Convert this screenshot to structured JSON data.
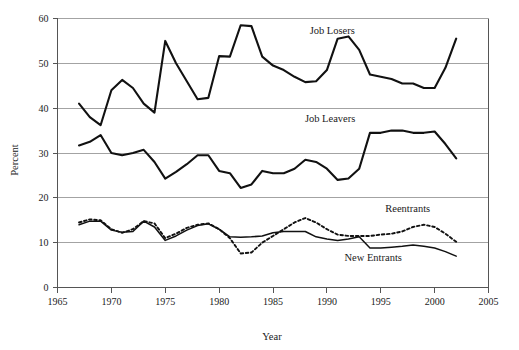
{
  "chart_data": {
    "type": "line",
    "title": "",
    "xlabel": "Year",
    "ylabel": "Percent",
    "xlim": [
      1965,
      2005
    ],
    "ylim": [
      0,
      60
    ],
    "xticks": [
      1965,
      1970,
      1975,
      1980,
      1985,
      1990,
      1995,
      2000,
      2005
    ],
    "xtick_labels": [
      "1965",
      "1970",
      "1975",
      "1980",
      "1985",
      "1990",
      "1995",
      "2000",
      "2005"
    ],
    "yticks": [
      0,
      10,
      20,
      30,
      40,
      50,
      60
    ],
    "ytick_labels": [
      "0",
      "10",
      "20",
      "30",
      "40",
      "50",
      "60"
    ],
    "grid": "horizontal",
    "legend_position": "inline-annotations",
    "x": [
      1967,
      1968,
      1969,
      1970,
      1971,
      1972,
      1973,
      1974,
      1975,
      1976,
      1977,
      1978,
      1979,
      1980,
      1981,
      1982,
      1983,
      1984,
      1985,
      1986,
      1987,
      1988,
      1989,
      1990,
      1991,
      1992,
      1993,
      1994,
      1995,
      1996,
      1997,
      1998,
      1999,
      2000,
      2001,
      2002
    ],
    "series": [
      {
        "name": "Job Losers",
        "style": "solid",
        "values": [
          41.0,
          38.0,
          36.2,
          44.0,
          46.3,
          44.5,
          41.0,
          39.0,
          55.0,
          50.0,
          46.0,
          42.0,
          42.3,
          51.6,
          51.5,
          58.5,
          58.3,
          51.5,
          49.5,
          48.5,
          47.0,
          45.8,
          46.0,
          48.5,
          55.5,
          56.0,
          53.0,
          47.5,
          47.0,
          46.5,
          45.5,
          45.5,
          44.5,
          44.5,
          49.0,
          55.5
        ]
      },
      {
        "name": "Job Leavers",
        "style": "solid",
        "values": [
          31.7,
          32.5,
          34.0,
          30.0,
          29.5,
          30.0,
          30.7,
          28.0,
          24.3,
          25.8,
          27.5,
          29.5,
          29.5,
          26.0,
          25.5,
          22.2,
          23.0,
          26.0,
          25.5,
          25.5,
          26.5,
          28.5,
          28.0,
          26.5,
          24.0,
          24.3,
          26.5,
          34.5,
          34.5,
          35.0,
          35.0,
          34.5,
          34.5,
          34.8,
          32.0,
          28.8
        ]
      },
      {
        "name": "Reentrants",
        "style": "dotted",
        "values": [
          14.5,
          15.2,
          15.0,
          13.0,
          12.2,
          13.0,
          14.8,
          14.3,
          11.0,
          12.0,
          13.3,
          14.0,
          14.3,
          13.0,
          11.0,
          7.6,
          7.8,
          10.0,
          11.5,
          13.0,
          14.5,
          15.5,
          14.5,
          13.0,
          11.8,
          11.5,
          11.5,
          11.5,
          11.8,
          12.0,
          12.5,
          13.5,
          14.0,
          13.5,
          12.0,
          10.2
        ]
      },
      {
        "name": "New Entrants",
        "style": "solid-thin",
        "values": [
          14.0,
          14.8,
          14.8,
          12.8,
          12.3,
          12.5,
          14.8,
          13.5,
          10.5,
          11.5,
          12.8,
          13.8,
          14.2,
          13.0,
          11.3,
          11.2,
          11.3,
          11.5,
          12.2,
          12.5,
          12.5,
          12.5,
          11.3,
          10.8,
          10.5,
          10.8,
          11.3,
          8.8,
          8.8,
          9.0,
          9.2,
          9.5,
          9.2,
          8.8,
          8.0,
          7.0
        ]
      }
    ],
    "annotations": [
      {
        "text": "Job Losers",
        "x": 1990.5,
        "y": 56.5
      },
      {
        "text": "Job Leavers",
        "x": 1990.3,
        "y": 37.0
      },
      {
        "text": "Reentrants",
        "x": 1997.5,
        "y": 16.8
      },
      {
        "text": "New Entrants",
        "x": 1994.3,
        "y": 5.8
      }
    ],
    "colors": {
      "line": "#111111",
      "grid": "#8c8c8c",
      "axis": "#555555",
      "text": "#1a1a1a",
      "background": "#ffffff"
    }
  }
}
